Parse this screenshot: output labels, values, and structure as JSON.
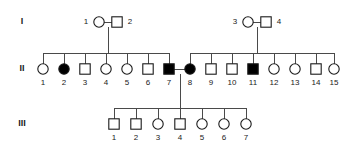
{
  "figure": {
    "type": "pedigree-chart",
    "symbol_legend": {
      "square": "male",
      "circle": "female",
      "filled": "affected",
      "open": "unaffected"
    },
    "colors": {
      "line": "#4a4a4a",
      "symbol_stroke": "#1a1a1a",
      "affected_fill": "#000000",
      "unaffected_fill": "#ffffff",
      "text": "#1a1a1a",
      "background": "#ffffff"
    }
  },
  "generations": [
    {
      "label": "I",
      "label_x": 22,
      "label_y": 22,
      "individuals": [
        {
          "id": "1",
          "sex": "female",
          "shape": "circle",
          "affected": false,
          "x": 99,
          "y": 22,
          "label_x": 86,
          "label_y": 22
        },
        {
          "id": "2",
          "sex": "male",
          "shape": "square",
          "affected": false,
          "x": 117,
          "y": 22,
          "label_x": 130,
          "label_y": 22
        },
        {
          "id": "3",
          "sex": "female",
          "shape": "circle",
          "affected": false,
          "x": 248,
          "y": 22,
          "label_x": 235,
          "label_y": 22
        },
        {
          "id": "4",
          "sex": "male",
          "shape": "square",
          "affected": false,
          "x": 266,
          "y": 22,
          "label_x": 279,
          "label_y": 22
        }
      ]
    },
    {
      "label": "II",
      "label_x": 22,
      "label_y": 69,
      "individuals": [
        {
          "id": "1",
          "sex": "female",
          "shape": "circle",
          "affected": false,
          "x": 43,
          "y": 69,
          "label_x": 43,
          "label_y": 83
        },
        {
          "id": "2",
          "sex": "female",
          "shape": "circle",
          "affected": true,
          "x": 64,
          "y": 69,
          "label_x": 64,
          "label_y": 83
        },
        {
          "id": "3",
          "sex": "male",
          "shape": "square",
          "affected": false,
          "x": 85,
          "y": 69,
          "label_x": 85,
          "label_y": 83
        },
        {
          "id": "4",
          "sex": "female",
          "shape": "circle",
          "affected": false,
          "x": 106,
          "y": 69,
          "label_x": 106,
          "label_y": 83
        },
        {
          "id": "5",
          "sex": "female",
          "shape": "circle",
          "affected": false,
          "x": 127,
          "y": 69,
          "label_x": 127,
          "label_y": 83
        },
        {
          "id": "6",
          "sex": "male",
          "shape": "square",
          "affected": false,
          "x": 148,
          "y": 69,
          "label_x": 148,
          "label_y": 83
        },
        {
          "id": "7",
          "sex": "male",
          "shape": "square",
          "affected": true,
          "x": 169,
          "y": 69,
          "label_x": 169,
          "label_y": 83
        },
        {
          "id": "8",
          "sex": "female",
          "shape": "circle",
          "affected": true,
          "x": 190,
          "y": 69,
          "label_x": 190,
          "label_y": 83
        },
        {
          "id": "9",
          "sex": "male",
          "shape": "square",
          "affected": false,
          "x": 211,
          "y": 69,
          "label_x": 211,
          "label_y": 83
        },
        {
          "id": "10",
          "sex": "male",
          "shape": "square",
          "affected": false,
          "x": 232,
          "y": 69,
          "label_x": 232,
          "label_y": 83
        },
        {
          "id": "11",
          "sex": "male",
          "shape": "square",
          "affected": true,
          "x": 253,
          "y": 69,
          "label_x": 253,
          "label_y": 83
        },
        {
          "id": "12",
          "sex": "female",
          "shape": "circle",
          "affected": false,
          "x": 274,
          "y": 69,
          "label_x": 274,
          "label_y": 83
        },
        {
          "id": "13",
          "sex": "female",
          "shape": "circle",
          "affected": false,
          "x": 295,
          "y": 69,
          "label_x": 295,
          "label_y": 83
        },
        {
          "id": "14",
          "sex": "male",
          "shape": "square",
          "affected": false,
          "x": 316,
          "y": 69,
          "label_x": 316,
          "label_y": 83
        },
        {
          "id": "15",
          "sex": "female",
          "shape": "circle",
          "affected": false,
          "x": 334,
          "y": 69,
          "label_x": 334,
          "label_y": 83
        }
      ]
    },
    {
      "label": "III",
      "label_x": 22,
      "label_y": 124,
      "individuals": [
        {
          "id": "1",
          "sex": "male",
          "shape": "square",
          "affected": false,
          "x": 114,
          "y": 124,
          "label_x": 114,
          "label_y": 138
        },
        {
          "id": "2",
          "sex": "male",
          "shape": "square",
          "affected": false,
          "x": 136,
          "y": 124,
          "label_x": 136,
          "label_y": 138
        },
        {
          "id": "3",
          "sex": "female",
          "shape": "circle",
          "affected": false,
          "x": 158,
          "y": 124,
          "label_x": 158,
          "label_y": 138
        },
        {
          "id": "4",
          "sex": "male",
          "shape": "square",
          "affected": false,
          "x": 180,
          "y": 124,
          "label_x": 180,
          "label_y": 138
        },
        {
          "id": "5",
          "sex": "female",
          "shape": "circle",
          "affected": false,
          "x": 202,
          "y": 124,
          "label_x": 202,
          "label_y": 138
        },
        {
          "id": "6",
          "sex": "female",
          "shape": "circle",
          "affected": false,
          "x": 224,
          "y": 124,
          "label_x": 224,
          "label_y": 138
        },
        {
          "id": "7",
          "sex": "female",
          "shape": "circle",
          "affected": false,
          "x": 246,
          "y": 124,
          "label_x": 246,
          "label_y": 138
        }
      ]
    }
  ],
  "matings": [
    {
      "name": "I-1-x-I-2",
      "x1": 104,
      "x2": 112,
      "y": 22
    },
    {
      "name": "I-3-x-I-4",
      "x1": 253,
      "x2": 261,
      "y": 22
    },
    {
      "name": "II-7-x-II-8",
      "x1": 174,
      "x2": 185,
      "y": 69
    }
  ],
  "descent_lines": [
    {
      "name": "I-couple-left-drop",
      "x": 108,
      "y1": 27,
      "y2": 53
    },
    {
      "name": "I-couple-right-drop",
      "x": 257,
      "y1": 27,
      "y2": 53
    },
    {
      "name": "II-couple-drop",
      "x": 180,
      "y1": 74,
      "y2": 108
    }
  ],
  "sibship_bars": [
    {
      "name": "sibship-left-genII",
      "x1": 43,
      "x2": 169,
      "y": 53,
      "drops_y2": 64
    },
    {
      "name": "sibship-right-genII",
      "x1": 190,
      "x2": 334,
      "y": 53,
      "drops_y2": 64
    },
    {
      "name": "sibship-genIII",
      "x1": 114,
      "x2": 246,
      "y": 108,
      "drops_y2": 119
    }
  ],
  "sibling_drops": {
    "left_genII": [
      43,
      64,
      85,
      106,
      127,
      148,
      169
    ],
    "right_genII": [
      190,
      211,
      232,
      253,
      274,
      295,
      316,
      334
    ],
    "genIII": [
      114,
      136,
      158,
      180,
      202,
      224,
      246
    ]
  },
  "symbol_size": {
    "circle_radius": 5.2,
    "square_half": 5.2
  }
}
